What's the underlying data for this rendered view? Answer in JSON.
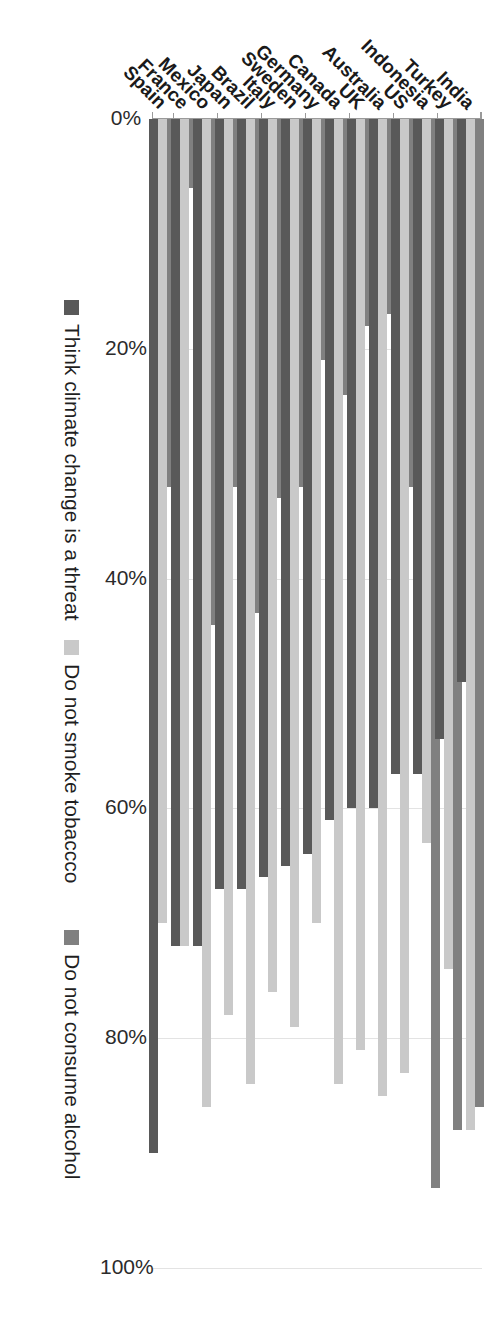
{
  "chart_data": {
    "type": "bar",
    "orientation": "horizontal",
    "title": "",
    "subtitle": "",
    "xlabel": "",
    "ylabel": "",
    "xlim": [
      0,
      100
    ],
    "xticks": [
      "0%",
      "20%",
      "40%",
      "60%",
      "80%",
      "100%"
    ],
    "xtick_values": [
      0,
      20,
      40,
      60,
      80,
      100
    ],
    "grid": true,
    "legend_position": "bottom",
    "categories": [
      "Spain",
      "France",
      "Mexico",
      "Japan",
      "Brazil",
      "Italy",
      "Sweden",
      "Germany",
      "Canada",
      "UK",
      "Australia",
      "US",
      "Indonesia",
      "Turkey",
      "India"
    ],
    "series": [
      {
        "name": "Think climate change is a threat",
        "color": "#595959",
        "values": [
          90,
          72,
          72,
          67,
          67,
          66,
          65,
          64,
          61,
          60,
          60,
          57,
          57,
          54,
          49
        ]
      },
      {
        "name": "Do not smoke tobaccco",
        "color": "#c9c9c9",
        "values": [
          70,
          72,
          86,
          78,
          84,
          76,
          79,
          70,
          84,
          81,
          85,
          83,
          63,
          74,
          88
        ]
      },
      {
        "name": "Do not consume alcohol",
        "color": "#808080",
        "values": [
          32,
          6,
          44,
          32,
          43,
          33,
          32,
          21,
          24,
          18,
          17,
          32,
          93,
          88,
          86
        ]
      }
    ]
  },
  "legend": {
    "items": [
      {
        "label": "Think climate change is a threat",
        "swatch": "series-0-swatch"
      },
      {
        "label": "Do not smoke tobaccco",
        "swatch": "series-1-swatch"
      },
      {
        "label": "Do not consume alcohol",
        "swatch": "series-2-swatch"
      }
    ]
  },
  "axis": {
    "x_tick_labels": [
      "0%",
      "20%",
      "40%",
      "60%",
      "80%",
      "100%"
    ]
  },
  "colors": {
    "series_0": "#595959",
    "series_1": "#c9c9c9",
    "series_2": "#808080",
    "gridline": "#e3e3e3",
    "axis": "#9a9a9a",
    "background": "#ffffff",
    "text": "#1a1a1a"
  }
}
